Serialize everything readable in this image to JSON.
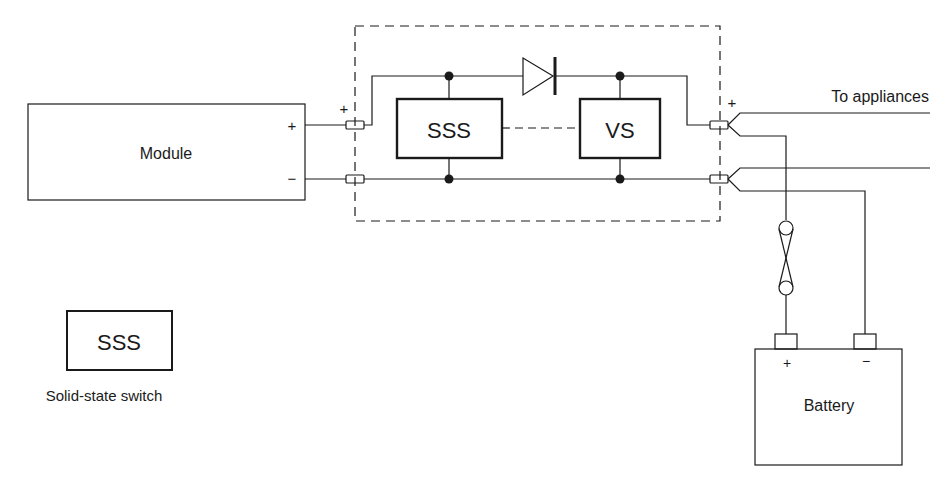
{
  "diagram": {
    "module": {
      "label": "Module",
      "plus": "+",
      "minus": "−"
    },
    "controller": {
      "input_plus": "+",
      "output_plus": "+",
      "sss_label": "SSS",
      "vs_label": "VS"
    },
    "outputs": {
      "appliances_label": "To appliances"
    },
    "battery": {
      "label": "Battery",
      "plus": "+",
      "minus": "−"
    },
    "legend": {
      "symbol_label": "SSS",
      "description": "Solid-state switch"
    }
  },
  "colors": {
    "line": "#1a1a1a",
    "background": "#ffffff"
  }
}
